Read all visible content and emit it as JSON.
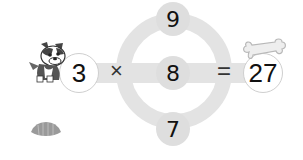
{
  "puzzle": {
    "left_operand": "3",
    "operator": "×",
    "equals": "=",
    "result": "27",
    "choices": {
      "top": "9",
      "middle": "8",
      "bottom": "7"
    }
  },
  "decorations": {
    "left_character": "dog-icon",
    "right_item": "bone-icon",
    "bottom_left_item": "shell-icon"
  },
  "colors": {
    "track": "#e3e3e3",
    "node": "#dedede",
    "text": "#111111",
    "operand_border": "#cfcfcf"
  }
}
